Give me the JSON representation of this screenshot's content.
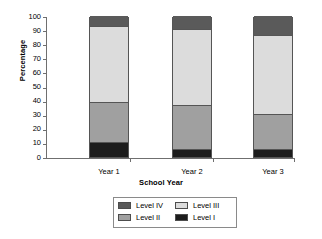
{
  "chart_data": {
    "type": "bar",
    "subtype": "stacked-bar-percentage",
    "title": "",
    "xlabel": "School Year",
    "ylabel": "Percentage",
    "categories": [
      "Year 1",
      "Year 2",
      "Year 3"
    ],
    "ylim": [
      0,
      100
    ],
    "yticks": [
      0,
      10,
      20,
      30,
      40,
      50,
      60,
      70,
      80,
      90,
      100
    ],
    "ytick_labels": [
      "0",
      "10",
      "20",
      "30",
      "40",
      "50",
      "60",
      "70",
      "80",
      "90",
      "100"
    ],
    "grid": false,
    "legend_position": "bottom",
    "legend_order": [
      "Level IV",
      "Level III",
      "Level II",
      "Level I"
    ],
    "series": [
      {
        "name": "Level I",
        "color": "#1c1c1c",
        "values": [
          10,
          5,
          5
        ]
      },
      {
        "name": "Level II",
        "color": "#a0a0a0",
        "values": [
          28,
          31,
          25
        ]
      },
      {
        "name": "Level III",
        "color": "#dcdcdc",
        "values": [
          54,
          54,
          56
        ]
      },
      {
        "name": "Level IV",
        "color": "#5a5a5a",
        "values": [
          8,
          10,
          14
        ]
      }
    ],
    "cumulative_tops": {
      "Year 1": {
        "Level I": 10,
        "Level II": 38,
        "Level III": 92,
        "Level IV": 100
      },
      "Year 2": {
        "Level I": 5,
        "Level II": 36,
        "Level III": 90,
        "Level IV": 100
      },
      "Year 3": {
        "Level I": 5,
        "Level II": 30,
        "Level III": 86,
        "Level IV": 100
      }
    }
  },
  "legend": {
    "items": [
      {
        "label": "Level IV",
        "color": "#5a5a5a"
      },
      {
        "label": "Level III",
        "color": "#dcdcdc"
      },
      {
        "label": "Level II",
        "color": "#a0a0a0"
      },
      {
        "label": "Level I",
        "color": "#1c1c1c"
      }
    ]
  },
  "colors": {
    "axis": "#6f6f6f",
    "bar_border": "#555555",
    "legend_border": "#8a8a8a",
    "background": "#ffffff",
    "text": "#000000"
  }
}
